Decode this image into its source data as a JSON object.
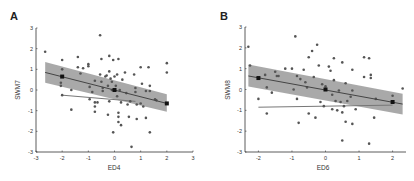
{
  "chart_data": [
    {
      "panel": "A",
      "type": "scatter",
      "title": "",
      "xlabel": "ED4",
      "ylabel": "SWM7",
      "xlim": [
        -3,
        3
      ],
      "ylim": [
        -3,
        3
      ],
      "xticks": [
        -3,
        -2,
        -1,
        0,
        1,
        2,
        3
      ],
      "yticks": [
        -3,
        -2,
        -1,
        0,
        1,
        2,
        3
      ],
      "grid": false,
      "legend": null,
      "points": [
        [
          -2.65,
          1.85
        ],
        [
          -2.0,
          1.45
        ],
        [
          -2.0,
          1.0
        ],
        [
          -2.05,
          0.35
        ],
        [
          -2.05,
          0.2
        ],
        [
          -2.0,
          -0.25
        ],
        [
          -1.65,
          0.0
        ],
        [
          -1.65,
          -0.95
        ],
        [
          -1.4,
          1.6
        ],
        [
          -1.4,
          1.1
        ],
        [
          -1.3,
          0.8
        ],
        [
          -1.2,
          1.05
        ],
        [
          -1.0,
          1.25
        ],
        [
          -1.0,
          1.15
        ],
        [
          -0.95,
          0.15
        ],
        [
          -0.95,
          -0.45
        ],
        [
          -0.85,
          -0.1
        ],
        [
          -0.75,
          0.45
        ],
        [
          -0.75,
          -0.6
        ],
        [
          -0.75,
          -0.8
        ],
        [
          -0.75,
          -1.05
        ],
        [
          -0.65,
          -0.6
        ],
        [
          -0.55,
          2.65
        ],
        [
          -0.5,
          1.5
        ],
        [
          -0.55,
          0.75
        ],
        [
          -0.5,
          0.4
        ],
        [
          -0.45,
          0.1
        ],
        [
          -0.45,
          -0.05
        ],
        [
          -0.35,
          0.65
        ],
        [
          -0.3,
          0.7
        ],
        [
          -0.25,
          0.2
        ],
        [
          -0.2,
          1.65
        ],
        [
          -0.2,
          0.9
        ],
        [
          -0.15,
          0.55
        ],
        [
          -0.1,
          0.4
        ],
        [
          -0.1,
          0.0
        ],
        [
          -0.2,
          -0.55
        ],
        [
          -0.25,
          -1.2
        ],
        [
          -0.05,
          1.45
        ],
        [
          0.0,
          0.65
        ],
        [
          0.05,
          0.2
        ],
        [
          0.1,
          0.75
        ],
        [
          0.1,
          -0.3
        ],
        [
          0.15,
          1.5
        ],
        [
          0.2,
          0.0
        ],
        [
          0.25,
          -0.6
        ],
        [
          0.15,
          -1.1
        ],
        [
          0.15,
          -1.3
        ],
        [
          0.15,
          -1.55
        ],
        [
          0.25,
          -1.7
        ],
        [
          0.3,
          0.5
        ],
        [
          -0.05,
          -2.05
        ],
        [
          0.4,
          0.85
        ],
        [
          0.45,
          -0.15
        ],
        [
          0.5,
          -0.7
        ],
        [
          0.55,
          -1.3
        ],
        [
          0.6,
          -0.55
        ],
        [
          0.65,
          -2.75
        ],
        [
          0.75,
          0.75
        ],
        [
          0.8,
          0.1
        ],
        [
          0.8,
          -0.1
        ],
        [
          0.85,
          -0.7
        ],
        [
          0.85,
          -1.4
        ],
        [
          1.0,
          1.1
        ],
        [
          1.0,
          -0.65
        ],
        [
          1.05,
          0.3
        ],
        [
          1.1,
          -0.8
        ],
        [
          1.2,
          -0.05
        ],
        [
          1.2,
          -1.35
        ],
        [
          1.3,
          1.1
        ],
        [
          1.35,
          0.2
        ],
        [
          1.35,
          -0.05
        ],
        [
          1.35,
          -2.05
        ],
        [
          1.55,
          -0.45
        ],
        [
          1.6,
          -0.5
        ],
        [
          2.0,
          1.3
        ],
        [
          2.0,
          0.85
        ],
        [
          2.0,
          -0.65
        ]
      ],
      "highlight_points": [
        [
          -2.0,
          0.65
        ],
        [
          0.0,
          0.0
        ],
        [
          2.0,
          -0.65
        ]
      ],
      "fit_line": {
        "x": [
          -2.65,
          2.0
        ],
        "y": [
          0.85,
          -0.65
        ]
      },
      "ci_band": {
        "x": [
          -2.65,
          2.0
        ],
        "upper": [
          1.35,
          -0.2
        ],
        "lower": [
          0.35,
          -1.05
        ]
      },
      "second_line": {
        "x": [
          -2.0,
          0.8
        ],
        "y": [
          -0.25,
          -0.55
        ]
      }
    },
    {
      "panel": "B",
      "type": "scatter",
      "title": "",
      "xlabel": "ED6",
      "ylabel": "SWM8",
      "xlim": [
        -2.4,
        2.4
      ],
      "ylim": [
        -3,
        3
      ],
      "xticks": [
        -2,
        -1,
        0,
        1,
        2
      ],
      "yticks": [
        -3,
        -2,
        -1,
        0,
        1,
        2,
        3
      ],
      "grid": false,
      "legend": null,
      "points": [
        [
          -2.3,
          2.05
        ],
        [
          -2.25,
          1.15
        ],
        [
          -2.0,
          -0.45
        ],
        [
          -1.8,
          0.7
        ],
        [
          -1.75,
          0.1
        ],
        [
          -1.75,
          -1.15
        ],
        [
          -1.6,
          -0.15
        ],
        [
          -1.5,
          0.85
        ],
        [
          -1.45,
          0.65
        ],
        [
          -1.4,
          0.65
        ],
        [
          -1.2,
          1.0
        ],
        [
          -1.0,
          1.0
        ],
        [
          -0.95,
          0.0
        ],
        [
          -0.9,
          2.55
        ],
        [
          -0.85,
          0.65
        ],
        [
          -0.85,
          -0.45
        ],
        [
          -0.8,
          -1.6
        ],
        [
          -0.75,
          0.5
        ],
        [
          -0.65,
          0.95
        ],
        [
          -0.6,
          0.35
        ],
        [
          -0.55,
          0.1
        ],
        [
          -0.5,
          1.55
        ],
        [
          -0.5,
          -1.15
        ],
        [
          -0.4,
          1.85
        ],
        [
          -0.35,
          0.6
        ],
        [
          -0.3,
          -1.35
        ],
        [
          -0.25,
          2.15
        ],
        [
          -0.2,
          1.15
        ],
        [
          -0.15,
          -0.6
        ],
        [
          -0.1,
          0.25
        ],
        [
          0.0,
          0.15
        ],
        [
          -0.05,
          -0.8
        ],
        [
          0.1,
          1.1
        ],
        [
          0.15,
          0.9
        ],
        [
          0.2,
          -0.25
        ],
        [
          0.2,
          -0.95
        ],
        [
          0.25,
          1.5
        ],
        [
          0.25,
          0.45
        ],
        [
          0.3,
          -0.55
        ],
        [
          0.35,
          -1.0
        ],
        [
          0.4,
          -0.05
        ],
        [
          0.45,
          -0.6
        ],
        [
          0.5,
          1.3
        ],
        [
          0.5,
          -1.1
        ],
        [
          0.5,
          -2.45
        ],
        [
          0.55,
          -0.8
        ],
        [
          0.6,
          0.3
        ],
        [
          0.6,
          -1.55
        ],
        [
          0.65,
          -0.55
        ],
        [
          0.75,
          -0.35
        ],
        [
          0.8,
          0.95
        ],
        [
          0.8,
          -0.05
        ],
        [
          0.8,
          -1.65
        ],
        [
          0.9,
          -0.95
        ],
        [
          1.15,
          1.55
        ],
        [
          1.15,
          0.6
        ],
        [
          1.3,
          1.5
        ],
        [
          1.3,
          -2.6
        ],
        [
          1.35,
          0.7
        ],
        [
          1.35,
          0.55
        ],
        [
          1.45,
          -1.35
        ],
        [
          1.5,
          -0.45
        ],
        [
          2.0,
          -0.3
        ],
        [
          2.3,
          0.05
        ]
      ],
      "highlight_points": [
        [
          -2.0,
          0.55
        ],
        [
          0.0,
          0.0
        ],
        [
          2.0,
          -0.6
        ]
      ],
      "fit_line": {
        "x": [
          -2.3,
          2.3
        ],
        "y": [
          0.65,
          -0.7
        ]
      },
      "ci_band": {
        "x": [
          -2.3,
          2.3
        ],
        "upper": [
          1.2,
          -0.2
        ],
        "lower": [
          0.15,
          -1.2
        ]
      },
      "second_line": {
        "x": [
          -2.0,
          2.0
        ],
        "y": [
          -0.85,
          -0.75
        ]
      }
    }
  ],
  "panels": [
    {
      "letter": "A",
      "xlabel": "ED4",
      "ylabel": "SWM7"
    },
    {
      "letter": "B",
      "xlabel": "ED6",
      "ylabel": "SWM8"
    }
  ]
}
